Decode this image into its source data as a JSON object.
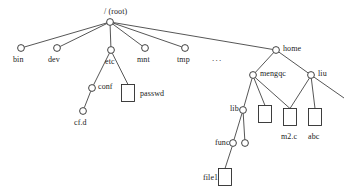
{
  "diagram": {
    "type": "tree-diagram",
    "background_color": "#ffffff",
    "line_color": "#2b2b2b",
    "node_fill_color": "#ffffff",
    "ellipsis": "...",
    "labels": {
      "root": "/ (root)",
      "bin": "bin",
      "dev": "dev",
      "etc": "etc",
      "mnt": "mnt",
      "tmp": "tmp",
      "home": "home",
      "conf": "conf",
      "passwd": "passwd",
      "cfd": "cf.d",
      "mengqc": "mengqc",
      "liu": "liu",
      "lib": "lib",
      "m2c": "m2.c",
      "abc": "abc",
      "func": "func",
      "file1": "file1"
    },
    "nodes": [
      {
        "id": "root",
        "label": "/ (root)",
        "shape": "circle",
        "x": 110,
        "y": 22,
        "label_x": 104,
        "label_y": 8,
        "label_anchor": "above"
      },
      {
        "id": "bin",
        "label": "bin",
        "shape": "circle",
        "x": 21,
        "y": 48,
        "label_x": 13,
        "label_y": 56,
        "label_anchor": "below"
      },
      {
        "id": "dev",
        "label": "dev",
        "shape": "circle",
        "x": 57,
        "y": 48,
        "label_x": 48,
        "label_y": 56,
        "label_anchor": "below"
      },
      {
        "id": "etc",
        "label": "etc",
        "shape": "circle",
        "x": 111,
        "y": 50,
        "label_x": 105,
        "label_y": 58,
        "label_anchor": "below"
      },
      {
        "id": "mnt",
        "label": "mnt",
        "shape": "circle",
        "x": 145,
        "y": 48,
        "label_x": 137,
        "label_y": 56,
        "label_anchor": "below"
      },
      {
        "id": "tmp",
        "label": "tmp",
        "shape": "circle",
        "x": 185,
        "y": 48,
        "label_x": 177,
        "label_y": 56,
        "label_anchor": "below"
      },
      {
        "id": "home",
        "label": "home",
        "shape": "circle",
        "x": 276,
        "y": 50,
        "label_x": 283,
        "label_y": 45,
        "label_anchor": "right"
      },
      {
        "id": "conf",
        "label": "conf",
        "shape": "circle",
        "x": 92,
        "y": 88,
        "label_x": 98,
        "label_y": 83,
        "label_anchor": "right"
      },
      {
        "id": "passwd",
        "label": "passwd",
        "shape": "box",
        "x": 128,
        "y": 93,
        "label_x": 140,
        "label_y": 90,
        "label_anchor": "right"
      },
      {
        "id": "cfd",
        "label": "cf.d",
        "shape": "circle",
        "x": 83,
        "y": 111,
        "label_x": 74,
        "label_y": 119,
        "label_anchor": "below"
      },
      {
        "id": "mengqc",
        "label": "mengqc",
        "shape": "circle",
        "x": 253,
        "y": 75,
        "label_x": 260,
        "label_y": 70,
        "label_anchor": "right"
      },
      {
        "id": "liu",
        "label": "liu",
        "shape": "circle",
        "x": 311,
        "y": 75,
        "label_x": 318,
        "label_y": 70,
        "label_anchor": "right"
      },
      {
        "id": "lib",
        "label": "lib",
        "shape": "circle",
        "x": 243,
        "y": 110,
        "label_x": 230,
        "label_y": 105,
        "label_anchor": "left"
      },
      {
        "id": "box_m1",
        "label": "",
        "shape": "box",
        "x": 265,
        "y": 114,
        "label_x": 0,
        "label_y": 0,
        "label_anchor": "none"
      },
      {
        "id": "m2c",
        "label": "m2.c",
        "shape": "box",
        "x": 290,
        "y": 117,
        "label_x": 281,
        "label_y": 133,
        "label_anchor": "below"
      },
      {
        "id": "abc",
        "label": "abc",
        "shape": "box",
        "x": 315,
        "y": 117,
        "label_x": 308,
        "label_y": 133,
        "label_anchor": "below"
      },
      {
        "id": "unnamed",
        "label": "",
        "shape": "circle",
        "x": 245,
        "y": 143,
        "label_x": 0,
        "label_y": 0,
        "label_anchor": "none"
      },
      {
        "id": "func",
        "label": "func",
        "shape": "circle",
        "x": 233,
        "y": 143,
        "label_x": 215,
        "label_y": 139,
        "label_anchor": "left"
      },
      {
        "id": "file1",
        "label": "file1",
        "shape": "box",
        "x": 225,
        "y": 177,
        "label_x": 203,
        "label_y": 174,
        "label_anchor": "left"
      }
    ],
    "edges": [
      {
        "from": "root",
        "to": "bin"
      },
      {
        "from": "root",
        "to": "dev"
      },
      {
        "from": "root",
        "to": "etc"
      },
      {
        "from": "root",
        "to": "mnt"
      },
      {
        "from": "root",
        "to": "tmp"
      },
      {
        "from": "root",
        "to": "home"
      },
      {
        "from": "etc",
        "to": "conf"
      },
      {
        "from": "etc",
        "to": "passwd"
      },
      {
        "from": "conf",
        "to": "cfd"
      },
      {
        "from": "home",
        "to": "mengqc"
      },
      {
        "from": "home",
        "to": "liu"
      },
      {
        "from": "mengqc",
        "to": "lib"
      },
      {
        "from": "mengqc",
        "to": "box_m1"
      },
      {
        "from": "mengqc",
        "to": "m2c"
      },
      {
        "from": "liu",
        "to": "m2c"
      },
      {
        "from": "liu",
        "to": "abc"
      },
      {
        "from": "lib",
        "to": "func"
      },
      {
        "from": "lib",
        "to": "unnamed"
      },
      {
        "from": "func",
        "to": "file1"
      }
    ],
    "ellipsis_marker": {
      "text": "...",
      "x": 212,
      "y": 54
    },
    "liu_stub_edge": {
      "x1": 311,
      "y1": 75,
      "x2": 344,
      "y2": 98
    }
  }
}
